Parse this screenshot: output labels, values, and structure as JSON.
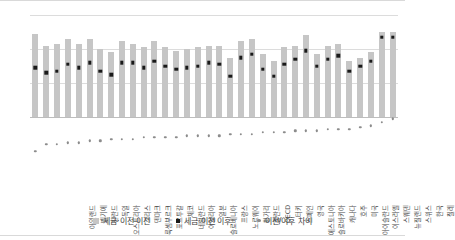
{
  "chart_data": {
    "type": "bar",
    "title": "",
    "xlabel": "",
    "ylabel": "",
    "ylim": [
      -0.2,
      0.6
    ],
    "yticks": [
      0.6,
      0.4,
      0.2,
      0.0,
      -0.2
    ],
    "ytick_labels": [
      "0,6",
      "0,4",
      "0,2",
      "0,0",
      "-0,2"
    ],
    "grid": true,
    "legend_position": "bottom",
    "decimal_separator": ",",
    "categories": [
      "아일랜드",
      "벨기에",
      "핀란드",
      "독일",
      "오스트리아",
      "그리스",
      "덴마크",
      "룩셈부르크",
      "포르투갈",
      "체코",
      "네덜란드",
      "이탈리아",
      "일본",
      "슬로베니아",
      "프랑스",
      "노르웨이",
      "헝가리",
      "폴란드",
      "OECD",
      "터키",
      "스페인",
      "영국",
      "에스토니아",
      "슬로바키아",
      "캐나다",
      "호주",
      "미국",
      "아이슬란드",
      "이스라엘",
      "스웨덴",
      "뉴질랜드",
      "스위스",
      "한국",
      "칠레"
    ],
    "series": [
      {
        "name": "세금·이전 이전",
        "type": "bar",
        "color": "#c6c6c6",
        "values": [
          0.49,
          0.42,
          0.43,
          0.46,
          0.43,
          0.46,
          0.4,
          0.38,
          0.45,
          0.43,
          0.41,
          0.45,
          0.41,
          0.39,
          0.4,
          0.41,
          0.42,
          0.42,
          0.35,
          0.45,
          0.46,
          0.37,
          0.33,
          0.41,
          0.42,
          0.48,
          0.37,
          0.42,
          0.43,
          0.33,
          0.35,
          0.38,
          0.5,
          0.5
        ]
      },
      {
        "name": "세금·이전 이후",
        "type": "scatter",
        "color": "#1a1a1a",
        "values": [
          0.29,
          0.26,
          0.27,
          0.31,
          0.29,
          0.32,
          0.27,
          0.25,
          0.32,
          0.32,
          0.29,
          0.33,
          0.3,
          0.28,
          0.29,
          0.3,
          0.32,
          0.31,
          0.24,
          0.35,
          0.37,
          0.28,
          0.24,
          0.31,
          0.34,
          0.39,
          0.3,
          0.34,
          0.36,
          0.27,
          0.3,
          0.33,
          0.47,
          0.47
        ]
      },
      {
        "name": "이전/이후 차이",
        "type": "scatter",
        "color": "#8c8c8c",
        "values": [
          -0.2,
          -0.16,
          -0.16,
          -0.15,
          -0.15,
          -0.14,
          -0.14,
          -0.13,
          -0.13,
          -0.13,
          -0.12,
          -0.12,
          -0.12,
          -0.12,
          -0.11,
          -0.11,
          -0.11,
          -0.11,
          -0.1,
          -0.1,
          -0.1,
          -0.09,
          -0.09,
          -0.09,
          -0.08,
          -0.08,
          -0.08,
          -0.07,
          -0.07,
          -0.07,
          -0.06,
          -0.05,
          -0.03,
          -0.01
        ]
      }
    ]
  },
  "legend": {
    "items": [
      {
        "label": "세금·이전 이전"
      },
      {
        "label": "세금·이전 이후"
      },
      {
        "label": "이전/이후 차이"
      }
    ]
  }
}
